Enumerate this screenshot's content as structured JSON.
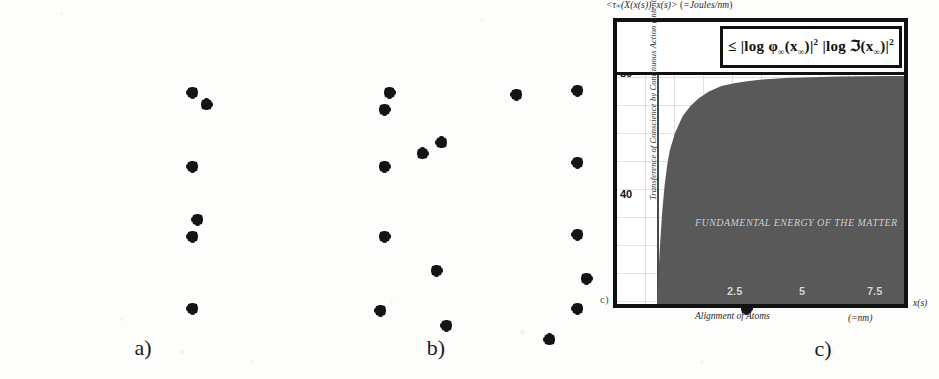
{
  "figure": {
    "panels": [
      {
        "id": "a",
        "caption": "a)",
        "kind": "scatter-box",
        "point_count": 16
      },
      {
        "id": "b",
        "caption": "b)",
        "kind": "grid-box",
        "point_count": 16
      },
      {
        "id": "c",
        "caption": "c)",
        "kind": "chart",
        "marker": "c)"
      }
    ]
  },
  "panel_a": {
    "caption": "a)",
    "points": [
      {
        "x": 45.0,
        "y": 40.5
      },
      {
        "x": 74.5,
        "y": 37.0
      },
      {
        "x": 22.0,
        "y": 27.5
      },
      {
        "x": 41.0,
        "y": 29.0
      },
      {
        "x": 55.0,
        "y": 25.0
      },
      {
        "x": 47.0,
        "y": 37.5
      },
      {
        "x": 67.0,
        "y": 44.5
      },
      {
        "x": 21.0,
        "y": 58.0
      },
      {
        "x": 78.0,
        "y": 59.5
      },
      {
        "x": 71.0,
        "y": 65.5
      },
      {
        "x": 46.5,
        "y": 71.5
      },
      {
        "x": 62.5,
        "y": 73.5
      },
      {
        "x": 73.5,
        "y": 70.5
      },
      {
        "x": 78.0,
        "y": 76.0
      },
      {
        "x": 47.5,
        "y": 86.0
      },
      {
        "x": 58.5,
        "y": 89.5
      }
    ]
  },
  "panel_b": {
    "caption": "b)",
    "columns": 4,
    "rows": 4,
    "points": [
      {
        "x": 20.5,
        "y": 24.5
      },
      {
        "x": 41.5,
        "y": 24.5
      },
      {
        "x": 61.5,
        "y": 24.0
      },
      {
        "x": 80.0,
        "y": 25.0
      },
      {
        "x": 20.5,
        "y": 44.0
      },
      {
        "x": 41.0,
        "y": 44.0
      },
      {
        "x": 61.5,
        "y": 43.0
      },
      {
        "x": 80.0,
        "y": 43.5
      },
      {
        "x": 20.5,
        "y": 62.5
      },
      {
        "x": 41.0,
        "y": 62.5
      },
      {
        "x": 61.5,
        "y": 62.0
      },
      {
        "x": 80.0,
        "y": 62.0
      },
      {
        "x": 20.5,
        "y": 81.5
      },
      {
        "x": 40.5,
        "y": 82.0
      },
      {
        "x": 61.5,
        "y": 81.5
      },
      {
        "x": 79.5,
        "y": 81.5
      }
    ]
  },
  "chart_data": {
    "type": "area",
    "caption": "c)",
    "marker": "c)",
    "title": "<τ∞(X(x(s)), x(s)> (=Joules/nm)",
    "title_plain": "<t∞(X(x(s)), x(s)> (=Joules/nm)",
    "formula": "≤ |log φ∞(x∞)|² |log ℑ(x∞)|²",
    "region_label": "FUNDAMENTAL ENERGY OF THE MATTER",
    "ylabel": "Transference of Conscience by Continuous Action (Intention)",
    "xlabel": "Alignment of Atoms",
    "xunit": "(=nm)",
    "xaxis_var": "x(s)",
    "yunit": "Joules/nm",
    "xticks": [
      "2.5",
      "5",
      "7.5"
    ],
    "xtick_values": [
      2.5,
      5,
      7.5
    ],
    "yticks": [
      "80",
      "40"
    ],
    "ytick_values": [
      80,
      40
    ],
    "xlim": [
      0,
      9.6
    ],
    "ylim": [
      0,
      95
    ],
    "grid": true,
    "legend": "none",
    "fill_color": "#595959",
    "frame_color": "#111111",
    "x": [
      0.0,
      0.1,
      0.2,
      0.3,
      0.4,
      0.5,
      0.7,
      1.0,
      1.3,
      1.6,
      2.0,
      2.5,
      3.0,
      3.5,
      4.0,
      5.0,
      6.0,
      7.0,
      8.0,
      9.0,
      9.6
    ],
    "y": [
      0,
      18,
      32,
      42,
      49,
      54,
      60,
      66,
      69.5,
      72,
      74.5,
      76.5,
      77.5,
      78.2,
      78.7,
      79.3,
      79.6,
      79.8,
      79.9,
      80.0,
      80.0
    ],
    "series": [
      {
        "name": "Fundamental energy of the matter",
        "description": "Saturating curve rising steeply from 0 and asymptotically approaching 80 Joules/nm; the area beneath it is filled solid gray.",
        "asymptote": 80
      }
    ]
  },
  "colors": {
    "ink": "#111111",
    "paper": "#fdfdfb",
    "fill_gray": "#595959",
    "grid_blue": "#96a5b4"
  }
}
